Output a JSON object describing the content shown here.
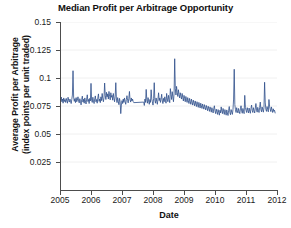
{
  "chart_data": {
    "type": "line",
    "title": "Median Profit per Arbitrage Opportunity",
    "xlabel": "Date",
    "ylabel_line1": "Average Profit per Arbitrage",
    "ylabel_line2": "(index points per unit traded)",
    "xlim": [
      2005.0,
      2012.0
    ],
    "ylim": [
      0,
      0.15
    ],
    "grid": "horizontal-faint",
    "legend": "none",
    "line_color": "#2d4e8a",
    "xticks": [
      2005,
      2006,
      2007,
      2008,
      2009,
      2010,
      2011,
      2012
    ],
    "xtick_labels": [
      "2005",
      "2006",
      "2007",
      "2008",
      "2009",
      "2010",
      "2011",
      "2012"
    ],
    "yticks": [
      0.025,
      0.05,
      0.075,
      0.1,
      0.125,
      0.15
    ],
    "ytick_labels": [
      "0.025",
      "0.05",
      "0.075",
      "0.1",
      "0.125",
      "0.15"
    ],
    "series": [
      {
        "name": "Median profit per arbitrage opportunity",
        "gaps": [
          [
            2007.38,
            2007.68
          ]
        ],
        "x": [
          2005.0,
          2005.02,
          2005.04,
          2005.06,
          2005.08,
          2005.1,
          2005.12,
          2005.14,
          2005.16,
          2005.18,
          2005.2,
          2005.22,
          2005.24,
          2005.26,
          2005.28,
          2005.3,
          2005.32,
          2005.34,
          2005.36,
          2005.38,
          2005.4,
          2005.42,
          2005.44,
          2005.46,
          2005.48,
          2005.5,
          2005.52,
          2005.54,
          2005.56,
          2005.58,
          2005.6,
          2005.62,
          2005.64,
          2005.66,
          2005.68,
          2005.7,
          2005.72,
          2005.74,
          2005.76,
          2005.78,
          2005.8,
          2005.82,
          2005.84,
          2005.86,
          2005.88,
          2005.9,
          2005.92,
          2005.94,
          2005.96,
          2005.98,
          2006.0,
          2006.02,
          2006.04,
          2006.06,
          2006.08,
          2006.1,
          2006.12,
          2006.14,
          2006.16,
          2006.18,
          2006.2,
          2006.22,
          2006.24,
          2006.26,
          2006.28,
          2006.3,
          2006.32,
          2006.34,
          2006.36,
          2006.38,
          2006.4,
          2006.42,
          2006.44,
          2006.46,
          2006.48,
          2006.5,
          2006.52,
          2006.54,
          2006.56,
          2006.58,
          2006.6,
          2006.62,
          2006.64,
          2006.66,
          2006.68,
          2006.7,
          2006.72,
          2006.74,
          2006.76,
          2006.78,
          2006.8,
          2006.82,
          2006.84,
          2006.86,
          2006.88,
          2006.9,
          2006.92,
          2006.94,
          2006.96,
          2006.98,
          2007.0,
          2007.02,
          2007.04,
          2007.06,
          2007.08,
          2007.1,
          2007.12,
          2007.14,
          2007.16,
          2007.18,
          2007.2,
          2007.22,
          2007.24,
          2007.26,
          2007.28,
          2007.3,
          2007.32,
          2007.34,
          2007.36,
          2007.38,
          2007.7,
          2007.72,
          2007.74,
          2007.76,
          2007.78,
          2007.8,
          2007.82,
          2007.84,
          2007.86,
          2007.88,
          2007.9,
          2007.92,
          2007.94,
          2007.96,
          2007.98,
          2008.0,
          2008.02,
          2008.04,
          2008.06,
          2008.08,
          2008.1,
          2008.12,
          2008.14,
          2008.16,
          2008.18,
          2008.2,
          2008.22,
          2008.24,
          2008.26,
          2008.28,
          2008.3,
          2008.32,
          2008.34,
          2008.36,
          2008.38,
          2008.4,
          2008.42,
          2008.44,
          2008.46,
          2008.48,
          2008.5,
          2008.52,
          2008.54,
          2008.56,
          2008.58,
          2008.6,
          2008.62,
          2008.64,
          2008.66,
          2008.68,
          2008.7,
          2008.72,
          2008.74,
          2008.76,
          2008.78,
          2008.8,
          2008.82,
          2008.84,
          2008.86,
          2008.88,
          2008.9,
          2008.92,
          2008.94,
          2008.96,
          2008.98,
          2009.0,
          2009.02,
          2009.04,
          2009.06,
          2009.08,
          2009.1,
          2009.12,
          2009.14,
          2009.16,
          2009.18,
          2009.2,
          2009.22,
          2009.24,
          2009.26,
          2009.28,
          2009.3,
          2009.32,
          2009.34,
          2009.36,
          2009.38,
          2009.4,
          2009.42,
          2009.44,
          2009.46,
          2009.48,
          2009.5,
          2009.52,
          2009.54,
          2009.56,
          2009.58,
          2009.6,
          2009.62,
          2009.64,
          2009.66,
          2009.68,
          2009.7,
          2009.72,
          2009.74,
          2009.76,
          2009.78,
          2009.8,
          2009.82,
          2009.84,
          2009.86,
          2009.88,
          2009.9,
          2009.92,
          2009.94,
          2009.96,
          2009.98,
          2010.0,
          2010.02,
          2010.04,
          2010.06,
          2010.08,
          2010.1,
          2010.12,
          2010.14,
          2010.16,
          2010.18,
          2010.2,
          2010.22,
          2010.24,
          2010.26,
          2010.28,
          2010.3,
          2010.32,
          2010.34,
          2010.36,
          2010.38,
          2010.4,
          2010.42,
          2010.44,
          2010.46,
          2010.48,
          2010.5,
          2010.52,
          2010.54,
          2010.56,
          2010.58,
          2010.6,
          2010.62,
          2010.64,
          2010.66,
          2010.68,
          2010.7,
          2010.72,
          2010.74,
          2010.76,
          2010.78,
          2010.8,
          2010.82,
          2010.84,
          2010.86,
          2010.88,
          2010.9,
          2010.92,
          2010.94,
          2010.96,
          2010.98,
          2011.0,
          2011.02,
          2011.04,
          2011.06,
          2011.08,
          2011.1,
          2011.12,
          2011.14,
          2011.16,
          2011.18,
          2011.2,
          2011.22,
          2011.24,
          2011.26,
          2011.28,
          2011.3,
          2011.32,
          2011.34,
          2011.36,
          2011.38,
          2011.4,
          2011.42,
          2011.44,
          2011.46,
          2011.48,
          2011.5,
          2011.52,
          2011.54,
          2011.56,
          2011.58,
          2011.6,
          2011.62,
          2011.64,
          2011.66,
          2011.68,
          2011.7,
          2011.72,
          2011.74,
          2011.76,
          2011.78,
          2011.8,
          2011.82,
          2011.84,
          2011.86,
          2011.88,
          2011.9,
          2011.92,
          2011.94
        ],
        "y": [
          0.0805,
          0.0795,
          0.083,
          0.0788,
          0.0812,
          0.0775,
          0.0822,
          0.079,
          0.0808,
          0.0782,
          0.0818,
          0.0795,
          0.0775,
          0.0828,
          0.08,
          0.0785,
          0.0812,
          0.0795,
          0.0772,
          0.0808,
          0.0848,
          0.1065,
          0.083,
          0.0792,
          0.0815,
          0.078,
          0.0825,
          0.0788,
          0.0802,
          0.0832,
          0.0795,
          0.0778,
          0.0815,
          0.0792,
          0.076,
          0.0808,
          0.0838,
          0.0785,
          0.081,
          0.0775,
          0.0822,
          0.0795,
          0.0768,
          0.0812,
          0.085,
          0.079,
          0.0808,
          0.0772,
          0.0818,
          0.0795,
          0.0952,
          0.0802,
          0.0782,
          0.0828,
          0.0795,
          0.0772,
          0.0815,
          0.084,
          0.0788,
          0.0808,
          0.0775,
          0.0822,
          0.0858,
          0.0792,
          0.0812,
          0.078,
          0.0832,
          0.0798,
          0.0862,
          0.0815,
          0.0788,
          0.0828,
          0.0955,
          0.0845,
          0.0808,
          0.0872,
          0.0832,
          0.0858,
          0.0812,
          0.088,
          0.0835,
          0.0805,
          0.0868,
          0.0828,
          0.0845,
          0.0802,
          0.0862,
          0.082,
          0.0788,
          0.0838,
          0.0958,
          0.0812,
          0.078,
          0.0825,
          0.0792,
          0.0762,
          0.0818,
          0.0788,
          0.0682,
          0.0758,
          0.0798,
          0.0772,
          0.0812,
          0.0782,
          0.0822,
          0.0792,
          0.0765,
          0.0808,
          0.0842,
          0.08,
          0.0778,
          0.0818,
          0.088,
          0.0805,
          0.0785,
          0.0822,
          0.0795,
          0.0812,
          0.079,
          0.078,
          0.0785,
          0.0755,
          0.0812,
          0.0782,
          0.0898,
          0.0805,
          0.0775,
          0.0825,
          0.0795,
          0.0765,
          0.0808,
          0.0782,
          0.0895,
          0.0812,
          0.0788,
          0.0758,
          0.0818,
          0.0958,
          0.0802,
          0.0775,
          0.0822,
          0.0792,
          0.0765,
          0.0812,
          0.0868,
          0.0798,
          0.0822,
          0.0782,
          0.0812,
          0.0855,
          0.0795,
          0.0772,
          0.0818,
          0.0788,
          0.0832,
          0.0802,
          0.0775,
          0.0862,
          0.0812,
          0.0788,
          0.0845,
          0.0808,
          0.078,
          0.0905,
          0.0852,
          0.0808,
          0.0878,
          0.0832,
          0.0788,
          0.0865,
          0.1172,
          0.0905,
          0.0848,
          0.0925,
          0.0872,
          0.0835,
          0.0895,
          0.0852,
          0.0822,
          0.0868,
          0.0838,
          0.0812,
          0.0862,
          0.0828,
          0.0795,
          0.0845,
          0.0818,
          0.0788,
          0.0835,
          0.0808,
          0.0782,
          0.0825,
          0.0798,
          0.0772,
          0.0818,
          0.0792,
          0.0765,
          0.0812,
          0.0785,
          0.0758,
          0.0802,
          0.0778,
          0.0752,
          0.0795,
          0.0768,
          0.0745,
          0.0788,
          0.0762,
          0.0738,
          0.0782,
          0.0758,
          0.0732,
          0.0775,
          0.0752,
          0.0728,
          0.0768,
          0.0745,
          0.0722,
          0.0762,
          0.0738,
          0.0715,
          0.0755,
          0.0732,
          0.0708,
          0.0748,
          0.0725,
          0.0702,
          0.0742,
          0.0718,
          0.0695,
          0.0735,
          0.0712,
          0.0688,
          0.0728,
          0.0752,
          0.0705,
          0.0682,
          0.0722,
          0.0698,
          0.0675,
          0.0718,
          0.0692,
          0.0668,
          0.0712,
          0.0688,
          0.0742,
          0.0705,
          0.0682,
          0.0728,
          0.0698,
          0.0675,
          0.0718,
          0.0692,
          0.0668,
          0.0715,
          0.0688,
          0.0665,
          0.0712,
          0.0745,
          0.0692,
          0.0672,
          0.0718,
          0.0695,
          0.0675,
          0.0718,
          0.0812,
          0.1078,
          0.0762,
          0.0718,
          0.0692,
          0.0735,
          0.0708,
          0.0688,
          0.0728,
          0.0702,
          0.0682,
          0.0725,
          0.0752,
          0.0705,
          0.0685,
          0.0728,
          0.0702,
          0.0682,
          0.0845,
          0.0738,
          0.0712,
          0.0692,
          0.0735,
          0.0708,
          0.0688,
          0.0732,
          0.0705,
          0.0685,
          0.0728,
          0.0758,
          0.0712,
          0.0692,
          0.0735,
          0.0708,
          0.0688,
          0.0732,
          0.0772,
          0.0715,
          0.0695,
          0.0738,
          0.0712,
          0.0692,
          0.0735,
          0.0785,
          0.0718,
          0.0698,
          0.0742,
          0.0715,
          0.0695,
          0.0738,
          0.0962,
          0.0785,
          0.0722,
          0.0702,
          0.0745,
          0.0718,
          0.0698,
          0.0808,
          0.0748,
          0.0722,
          0.07,
          0.0742,
          0.0715,
          0.0692,
          0.0725,
          0.0702,
          0.0712,
          0.0688
        ]
      }
    ]
  }
}
